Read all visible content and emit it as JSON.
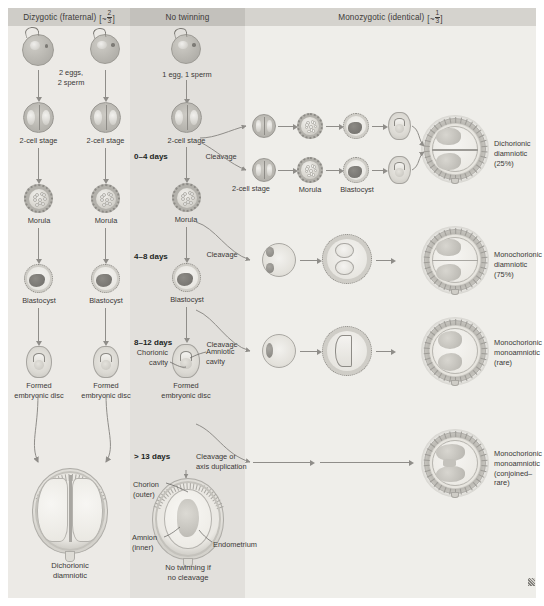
{
  "figure": {
    "columns": [
      {
        "id": "dizygotic",
        "header": "Dizygotic (fraternal)",
        "fraction_prefix": "[~",
        "fraction_num": "2",
        "fraction_den": "3",
        "fraction_suffix": "]"
      },
      {
        "id": "no-twinning",
        "header": "No twinning",
        "fraction_prefix": "",
        "fraction_num": "",
        "fraction_den": "",
        "fraction_suffix": ""
      },
      {
        "id": "monozygotic",
        "header": "Monozygotic (identical)",
        "fraction_prefix": "[~",
        "fraction_num": "1",
        "fraction_den": "3",
        "fraction_suffix": "]"
      }
    ],
    "colors": {
      "col_left_bg": "#eceae6",
      "col_mid_bg": "#e2e0dc",
      "col_right_bg": "#efeeea",
      "hdr_left_bg": "#cfcdc8",
      "hdr_mid_bg": "#c3c1bc",
      "hdr_right_bg": "#d5d3ce",
      "text": "#3a3836",
      "arrow": "#8f8d89"
    }
  },
  "dizygotic": {
    "gametes_note": "2 eggs,\n2 sperm",
    "stage_2cell_a": "2-cell stage",
    "stage_2cell_b": "2-cell stage",
    "morula_a": "Morula",
    "morula_b": "Morula",
    "blastocyst_a": "Blastocyst",
    "blastocyst_b": "Blastocyst",
    "disc_a": "Formed\nembryonic disc",
    "disc_b": "Formed\nembryonic disc",
    "result": "Dichorionic\ndiamniotic"
  },
  "no_twinning": {
    "gametes_note": "1 egg, 1 sperm",
    "stage_2cell": "2-cell stage",
    "morula": "Morula",
    "blastocyst": "Blastocyst",
    "chorionic_cavity": "Chorionic\ncavity",
    "amniotic_cavity": "Amniotic\ncavity",
    "formed_disc": "Formed\nembryonic disc",
    "chorion": "Chorion\n(outer)",
    "amnion": "Amnion\n(inner)",
    "endometrium": "Endometrium",
    "result": "No twinning if\nno cleavage"
  },
  "timeline": {
    "d0_4": "0–4 days",
    "d4_8": "4–8 days",
    "d8_12": "8–12 days",
    "d13": "> 13 days"
  },
  "cleavage_labels": {
    "c1": "Cleavage",
    "c2": "Cleavage",
    "c3": "Cleavage",
    "c4": "Cleavage or\naxis duplication"
  },
  "monozygotic": {
    "row1": {
      "stage_2cell": "2-cell stage",
      "morula": "Morula",
      "blastocyst": "Blastocyst",
      "result_line1": "Dichorionic",
      "result_line2": "diamniotic",
      "result_stat": "(25%)"
    },
    "row2": {
      "result_line1": "Monochorionic",
      "result_line2": "diamniotic",
      "result_stat": "(75%)"
    },
    "row3": {
      "result_line1": "Monochorionic",
      "result_line2": "monoamniotic",
      "result_stat": "(rare)"
    },
    "row4": {
      "result_line1": "Monochorionic",
      "result_line2": "monoamniotic",
      "result_stat": "(conjoined–rare)"
    }
  },
  "chart_data": {
    "type": "diagram",
    "categories": [
      "Dizygotic (fraternal)",
      "No twinning",
      "Monozygotic (identical)"
    ],
    "series": [
      {
        "name": "Dizygotic (fraternal)",
        "share": "~2/3",
        "outcome": "Dichorionic diamniotic",
        "outcome_share": null
      },
      {
        "name": "Monozygotic (identical)",
        "share": "~1/3",
        "outcomes": [
          {
            "cleavage_window_days": "0–4",
            "outcome": "Dichorionic diamniotic",
            "percent": 25
          },
          {
            "cleavage_window_days": "4–8",
            "outcome": "Monochorionic diamniotic",
            "percent": 75
          },
          {
            "cleavage_window_days": "8–12",
            "outcome": "Monochorionic monoamniotic",
            "percent": null,
            "note": "rare"
          },
          {
            "cleavage_window_days": "> 13",
            "outcome": "Monochorionic monoamniotic",
            "percent": null,
            "note": "conjoined–rare"
          }
        ]
      }
    ],
    "timeline_ticks": [
      "0–4 days",
      "4–8 days",
      "8–12 days",
      "> 13 days"
    ],
    "xlabel": "",
    "ylabel": "",
    "grid": false,
    "legend": "none"
  }
}
